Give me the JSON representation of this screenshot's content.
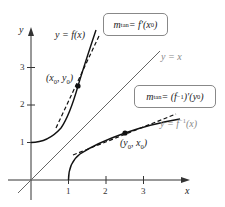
{
  "diagram": {
    "axes": {
      "x_label": "x",
      "y_label": "y",
      "x_ticks": [
        "1",
        "2",
        "3"
      ],
      "y_ticks": [
        "1",
        "2",
        "3"
      ]
    },
    "curves": {
      "f_label": "y = f(x)",
      "inverse_label": "y = f",
      "inverse_sup": "−1",
      "inverse_tail": "(x)",
      "identity_label": "y = x"
    },
    "points": {
      "p1": {
        "prefix": "(x",
        "sub1": "0",
        "mid": ", y",
        "sub2": "0",
        "suffix": ")"
      },
      "p2": {
        "prefix": "(y",
        "sub1": "0",
        "mid": ", x",
        "sub2": "0",
        "suffix": ")"
      }
    },
    "annotations": {
      "slope_f": {
        "m": "m",
        "m_sub": "tan",
        "eq": " = f′(x",
        "x_sub": "0",
        "close": ")"
      },
      "slope_inv": {
        "m": "m",
        "m_sub": "tan",
        "eq": " = (f",
        "sup": "−1",
        "rest": ")′(y",
        "y_sub": "0",
        "close": ")"
      }
    },
    "colors": {
      "curve": "#111111",
      "identity_line": "#555555",
      "axis": "#333333",
      "box_border": "#888888",
      "muted_label": "#888888"
    }
  }
}
